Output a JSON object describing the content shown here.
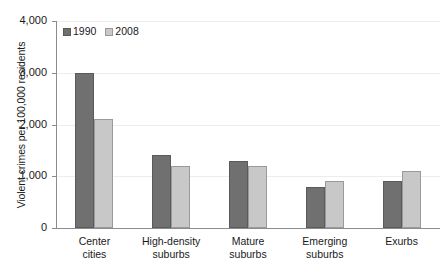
{
  "chart_data": {
    "type": "bar",
    "title": "",
    "subtitle": "",
    "xlabel": "",
    "ylabel": "Violent crimes per 100,000 residents",
    "ylim": [
      0,
      4000
    ],
    "yticks": [
      "0",
      "1,000",
      "2,000",
      "3,000",
      "4,000"
    ],
    "ytick_values": [
      0,
      1000,
      2000,
      3000,
      4000
    ],
    "grid": true,
    "grid_axis": "y",
    "legend_position": "top-left-inside",
    "categories": [
      "Center cities",
      "High-density suburbs",
      "Mature suburbs",
      "Emerging suburbs",
      "Exurbs"
    ],
    "category_lines": [
      [
        "Center",
        "cities"
      ],
      [
        "High-density",
        "suburbs"
      ],
      [
        "Mature",
        "suburbs"
      ],
      [
        "Emerging",
        "suburbs"
      ],
      [
        "Exurbs",
        ""
      ]
    ],
    "series": [
      {
        "name": "1990",
        "color": "#707070",
        "values": [
          3000,
          1420,
          1300,
          800,
          900
        ]
      },
      {
        "name": "2008",
        "color": "#c8c8c8",
        "values": [
          2100,
          1200,
          1200,
          900,
          1100
        ]
      }
    ]
  },
  "legend": {
    "items": [
      {
        "label": "1990"
      },
      {
        "label": "2008"
      }
    ]
  },
  "colors": {
    "series_1990": "#707070",
    "series_2008": "#c8c8c8",
    "axis": "#8c8c8c",
    "grid": "#ededed",
    "text": "#1a1a1a",
    "background": "#ffffff"
  }
}
